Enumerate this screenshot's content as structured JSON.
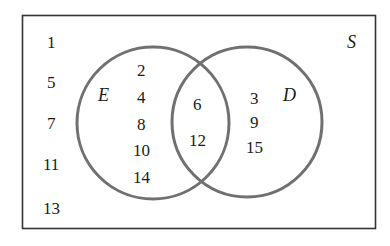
{
  "diagram": {
    "type": "venn",
    "universal_set": {
      "label": "S",
      "outside_elements": [
        "1",
        "5",
        "7",
        "11",
        "13"
      ]
    },
    "sets": [
      {
        "label": "E",
        "only_elements": [
          "2",
          "4",
          "8",
          "10",
          "14"
        ]
      },
      {
        "label": "D",
        "only_elements": [
          "3",
          "9",
          "15"
        ]
      }
    ],
    "intersection": {
      "sets": [
        "E",
        "D"
      ],
      "elements": [
        "6",
        "12"
      ]
    },
    "colors": {
      "border": "#333333",
      "circle_stroke": "#707070",
      "text": "#1a1a1a"
    }
  }
}
